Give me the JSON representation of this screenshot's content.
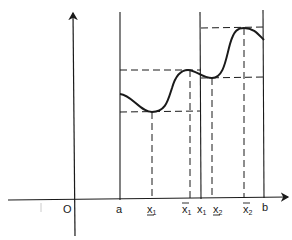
{
  "diagram": {
    "origin_label": "O",
    "axis_labels": {
      "a": "a",
      "x_under_1": "x",
      "x_under_1_sub": "1",
      "x_bar_1": "x",
      "x_bar_1_sub": "1",
      "x1": "x",
      "x1_sub": "1",
      "x_under_2": "x",
      "x_under_2_sub": "2",
      "x_bar_2": "x",
      "x_bar_2_sub": "2",
      "b": "b"
    },
    "colors": {
      "line": "#1a1a1a",
      "background": "#ffffff"
    },
    "points": {
      "a_x": 120,
      "x_under_1_x": 152,
      "x_bar_1_x": 190,
      "x1_x": 201,
      "x_under_2_x": 212,
      "x_bar_2_x": 244,
      "b_x": 264
    }
  }
}
